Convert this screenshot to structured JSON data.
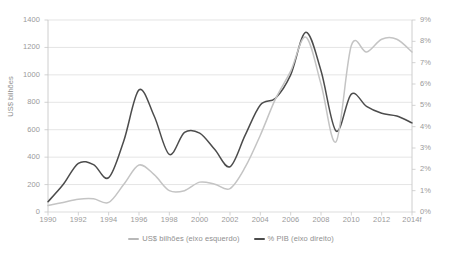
{
  "chart_data": {
    "type": "line",
    "title": "",
    "subtitle": "",
    "xlabel": "",
    "ylabel": "US$ bilhões",
    "y2label": "",
    "grid": true,
    "legend_position": "bottom",
    "x": [
      1990,
      1991,
      1992,
      1993,
      1994,
      1995,
      1996,
      1997,
      1998,
      1999,
      2000,
      2001,
      2002,
      2003,
      2004,
      2005,
      2006,
      2007,
      2008,
      2009,
      2010,
      2011,
      2012,
      2013,
      2014
    ],
    "x_tick_labels": [
      "1990",
      "1992",
      "1994",
      "1996",
      "1998",
      "2000",
      "2002",
      "2004",
      "2006",
      "2008",
      "2010",
      "2012",
      "2014f"
    ],
    "x_tick_values": [
      1990,
      1992,
      1994,
      1996,
      1998,
      2000,
      2002,
      2004,
      2006,
      2008,
      2010,
      2012,
      2014
    ],
    "xlim": [
      1990,
      2014
    ],
    "ylim": [
      0,
      1400
    ],
    "y_tick_labels": [
      "0",
      "200",
      "400",
      "600",
      "800",
      "1000",
      "1200",
      "1400"
    ],
    "y_tick_values": [
      0,
      200,
      400,
      600,
      800,
      1000,
      1200,
      1400
    ],
    "y2lim": [
      0,
      9
    ],
    "y2_tick_labels": [
      "0%",
      "1%",
      "2%",
      "3%",
      "4%",
      "5%",
      "6%",
      "7%",
      "8%",
      "9%"
    ],
    "y2_tick_values": [
      0,
      1,
      2,
      3,
      4,
      5,
      6,
      7,
      8,
      9
    ],
    "series": [
      {
        "name": "US$ bilhões (eixo esquerdo)",
        "axis": "left",
        "color": "#4c4c4c",
        "values": [
          75,
          200,
          355,
          345,
          250,
          520,
          890,
          700,
          420,
          580,
          575,
          455,
          330,
          560,
          780,
          830,
          1000,
          1310,
          1030,
          590,
          860,
          770,
          720,
          700,
          650
        ]
      },
      {
        "name": "% PIB (eixo direito)",
        "axis": "right",
        "color": "#c4c4c4",
        "values": [
          0.3,
          0.45,
          0.6,
          0.62,
          0.45,
          1.3,
          2.2,
          1.75,
          1.0,
          1.0,
          1.4,
          1.3,
          1.1,
          2.1,
          3.6,
          5.3,
          6.6,
          8.2,
          6.0,
          3.3,
          7.8,
          7.5,
          8.1,
          8.1,
          7.5
        ]
      }
    ]
  },
  "legend": {
    "items": [
      {
        "label": "US$ bilhões (eixo esquerdo)",
        "color": "#b8b8b8"
      },
      {
        "label": "% PIB (eixo direito)",
        "color": "#4c4c4c"
      }
    ]
  },
  "axes": {
    "left_title": "US$ bilhões"
  }
}
